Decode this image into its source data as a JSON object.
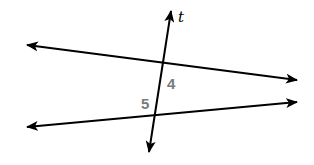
{
  "diagram": {
    "type": "parallel-lines-transversal",
    "transversal_label": "t",
    "angle_labels": [
      {
        "id": "angle-4",
        "text": "4"
      },
      {
        "id": "angle-5",
        "text": "5"
      }
    ],
    "colors": {
      "line": "#000000",
      "angle_label": "#7a7a7a",
      "background": "#ffffff"
    }
  }
}
